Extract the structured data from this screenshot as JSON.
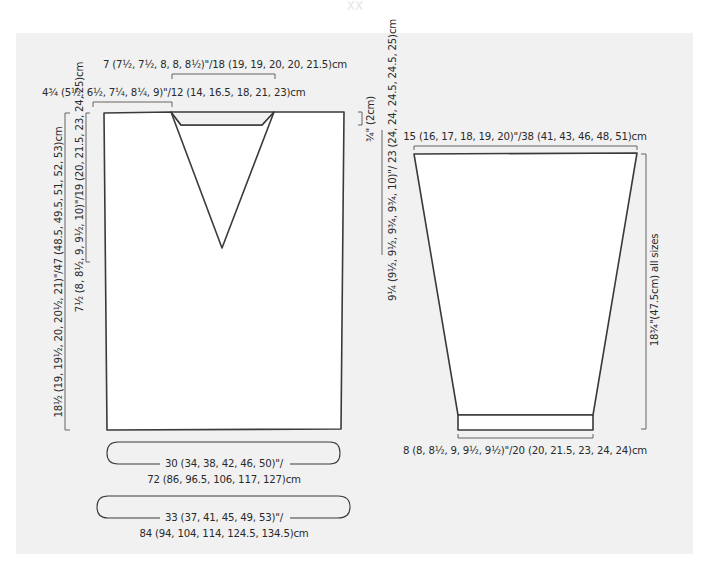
{
  "header_faded": "XX",
  "body_piece": {
    "neck_width": "7 (7½, 7½, 8, 8, 8½)\"/18 (19, 19, 20, 20, 21.5)cm",
    "shoulder_width": "4¾ (5½, 6½, 7¼, 8¼, 9)\"/12 (14, 16.5, 18, 21, 23)cm",
    "total_length": "18½ (19, 19½, 20, 20½, 21)\"/47 (48.5, 49.5, 51, 52, 53)cm",
    "v_neck_depth": "7½ (8, 8½, 9, 9½, 10)\"/19 (20, 21.5, 23, 24, 25)cm",
    "neck_drop": "¾\" (2cm)",
    "armhole_depth": "9¼ (9½, 9½, 9¾, 9¾, 10)\"/ 23 (24, 24, 24.5, 24.5, 25)cm",
    "width_line1": "30 (34, 38, 42, 46, 50)\"/",
    "width_line2": "72 (86, 96.5, 106, 117, 127)cm",
    "chest_line1": "33 (37, 41, 45, 49, 53)\"/",
    "chest_line2": "84 (94, 104, 114, 124.5, 134.5)cm"
  },
  "sleeve_piece": {
    "upper_width": "15 (16, 17, 18, 19, 20)\"/38 (41, 43, 46, 48, 51)cm",
    "length": "18¾\"(47.5cm) all sizes",
    "cuff_width": "8 (8, 8½, 9, 9½, 9½)\"/20 (20, 21.5, 23, 24, 24)cm"
  }
}
